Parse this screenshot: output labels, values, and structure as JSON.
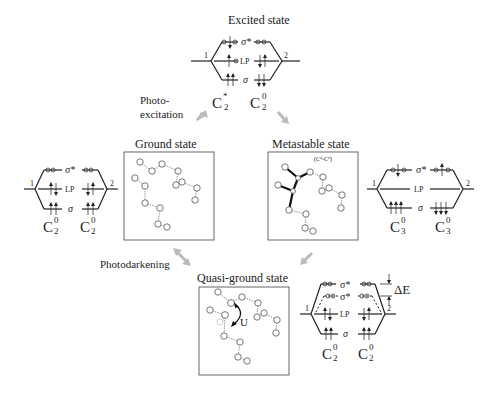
{
  "figure": {
    "states": {
      "excited": {
        "title": "Excited state",
        "left_label": "C",
        "left_sup": "*",
        "left_sub": "2",
        "right_label": "C",
        "right_sup": "0",
        "right_sub": "2"
      },
      "ground": {
        "title": "Ground state"
      },
      "ground_levels": {
        "left_label": "C",
        "left_sup": "0",
        "left_sub": "2",
        "right_label": "C",
        "right_sup": "0",
        "right_sub": "2"
      },
      "metastable": {
        "title": "Metastable state",
        "annotation": "(C⁰-C⁰)"
      },
      "metastable_levels": {
        "left_label": "C",
        "left_sup": "0",
        "left_sub": "3",
        "right_label": "C",
        "right_sup": "0",
        "right_sub": "3"
      },
      "quasi_ground": {
        "title": "Quasi-ground state",
        "u_label": "U"
      },
      "quasi_levels": {
        "left_label": "C",
        "left_sup": "0",
        "left_sub": "2",
        "right_label": "C",
        "right_sup": "0",
        "right_sub": "2",
        "delta": "ΔE"
      }
    },
    "level_labels": {
      "sigma_star": "σ*",
      "lp": "LP",
      "sigma": "σ",
      "site1": "1",
      "site2": "2"
    },
    "process_labels": {
      "photoexcitation_1": "Photo-",
      "photoexcitation_2": "excitation",
      "photodarkening": "Photodarkening"
    },
    "colors": {
      "arrow_gray": "#bbbbbb",
      "ink": "#222222"
    }
  }
}
